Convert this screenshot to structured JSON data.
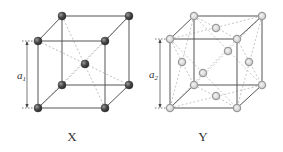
{
  "diagram": {
    "type": "crystal-unit-cells",
    "colors": {
      "edge": "#555555",
      "dashed": "#aaaaaa",
      "atom_x_fill": "#4a4a4a",
      "atom_y_fill": "#d8d8d8",
      "atom_y_stroke": "#9a9a9a"
    },
    "cells": [
      {
        "id": "X",
        "caption": "X",
        "lattice": "body-centered cubic",
        "dimension_label": "a",
        "dimension_subscript": "1",
        "corner_atoms": 8,
        "center_atoms": 1
      },
      {
        "id": "Y",
        "caption": "Y",
        "lattice": "face-centered cubic",
        "dimension_label": "a",
        "dimension_subscript": "2",
        "corner_atoms": 8,
        "face_center_atoms": 6
      }
    ]
  }
}
